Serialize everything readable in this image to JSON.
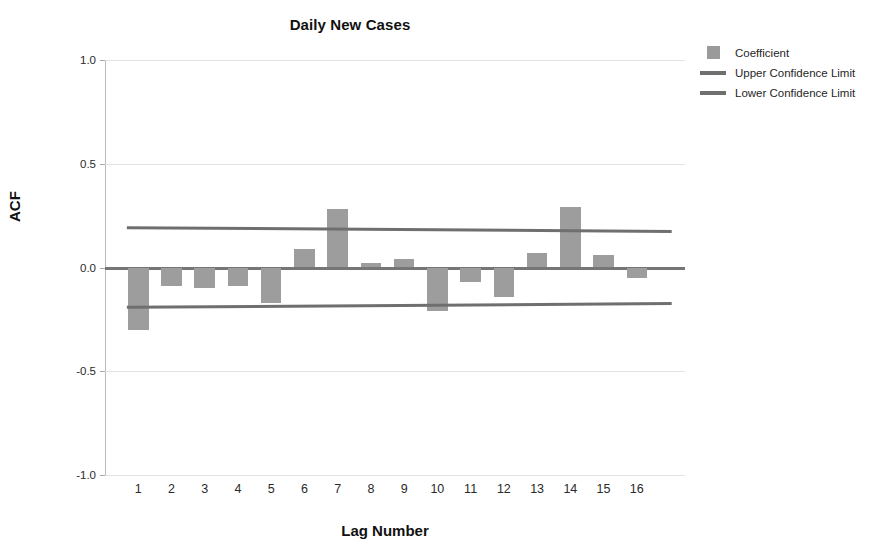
{
  "chart_data": {
    "type": "bar",
    "title": "Daily New Cases",
    "xlabel": "Lag Number",
    "ylabel": "ACF",
    "categories": [
      "1",
      "2",
      "3",
      "4",
      "5",
      "6",
      "7",
      "8",
      "9",
      "10",
      "11",
      "12",
      "13",
      "14",
      "15",
      "16"
    ],
    "values": [
      -0.3,
      -0.09,
      -0.1,
      -0.09,
      -0.17,
      0.09,
      0.28,
      0.02,
      0.04,
      -0.21,
      -0.07,
      -0.14,
      0.07,
      0.29,
      0.06,
      -0.05
    ],
    "series": [
      {
        "name": "Coefficient",
        "values": [
          -0.3,
          -0.09,
          -0.1,
          -0.09,
          -0.17,
          0.09,
          0.28,
          0.02,
          0.04,
          -0.21,
          -0.07,
          -0.14,
          0.07,
          0.29,
          0.06,
          -0.05
        ]
      },
      {
        "name": "Upper Confidence Limit",
        "values": [
          0.192,
          0.191,
          0.189,
          0.188,
          0.187,
          0.185,
          0.184,
          0.183,
          0.181,
          0.18,
          0.179,
          0.178,
          0.177,
          0.176,
          0.175,
          0.174
        ]
      },
      {
        "name": "Lower Confidence Limit",
        "values": [
          -0.192,
          -0.191,
          -0.189,
          -0.188,
          -0.187,
          -0.185,
          -0.184,
          -0.183,
          -0.181,
          -0.18,
          -0.179,
          -0.178,
          -0.177,
          -0.176,
          -0.175,
          -0.174
        ]
      }
    ],
    "ylim": [
      -1.0,
      1.0
    ],
    "yticks": [
      1.0,
      0.5,
      0.0,
      -0.5,
      -1.0
    ],
    "ytick_labels": [
      "1.0",
      "0.5",
      "0.0",
      "-0.5",
      "-1.0"
    ],
    "grid": true,
    "legend_position": "top-right",
    "colors": {
      "bar": "#9d9d9d",
      "limit_line": "#6f6f6f",
      "zero_line": "#767676",
      "gridline": "#e2e2e2",
      "axis": "#b9b9b9"
    }
  },
  "legend": {
    "items": [
      {
        "label": "Coefficient",
        "key": "swatch"
      },
      {
        "label": "Upper Confidence Limit",
        "key": "line"
      },
      {
        "label": "Lower Confidence Limit",
        "key": "line"
      }
    ]
  }
}
